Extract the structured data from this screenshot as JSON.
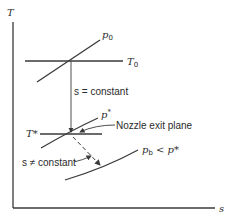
{
  "diagram": {
    "type": "T-s diagram",
    "axes": {
      "y_label": "T",
      "x_label": "s"
    },
    "lines": {
      "p0": {
        "symbol": "p",
        "subscript": "0"
      },
      "T0": {
        "symbol": "T",
        "subscript": "0"
      },
      "T_star": {
        "label": "T*"
      },
      "p_star": {
        "symbol": "p",
        "superscript": "*"
      },
      "pb": {
        "symbol": "p",
        "subscript": "b",
        "relation": " < p*"
      }
    },
    "annotations": {
      "isentropic": "s = constant",
      "nozzle_exit": "Nozzle exit plane",
      "non_isentropic": "s ≠ constant"
    }
  }
}
